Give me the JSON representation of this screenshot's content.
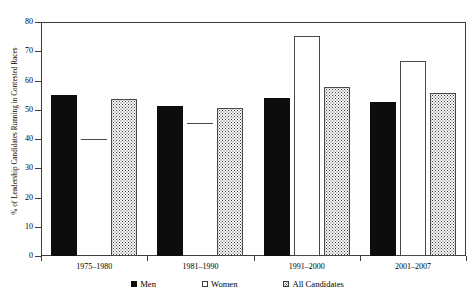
{
  "chart_data": {
    "type": "bar",
    "title": "",
    "xlabel": "",
    "ylabel": "% of Leadership Candidates Running in Contested Races",
    "ylim": [
      0,
      80
    ],
    "yticks": [
      0,
      10,
      20,
      30,
      40,
      50,
      60,
      70,
      80
    ],
    "grid": false,
    "legend_position": "bottom",
    "categories": [
      "1975–1980",
      "1981–1990",
      "1991–2000",
      "2001–2007"
    ],
    "series": [
      {
        "name": "Men",
        "pattern": "solid-black",
        "values": [
          55.2,
          51.3,
          54.0,
          52.5
        ]
      },
      {
        "name": "Women",
        "pattern": "open-white",
        "values": [
          40.0,
          45.5,
          75.3,
          66.8
        ]
      },
      {
        "name": "All Candidates",
        "pattern": "dotted",
        "values": [
          53.7,
          50.5,
          57.8,
          55.8
        ]
      }
    ]
  },
  "axis": {
    "y_title": "% of Leadership Candidates Running in Contested Races",
    "y_labels": [
      "80",
      "70",
      "60",
      "50",
      "40",
      "30",
      "20",
      "10",
      "0"
    ]
  },
  "legend": {
    "items": [
      {
        "label": "Men"
      },
      {
        "label": "Women"
      },
      {
        "label": "All Candidates"
      }
    ]
  },
  "colors": {
    "men": "#0d0d0d",
    "women": "#ffffff",
    "all_candidates": "#fdfdfd",
    "axis": "#3d3d3d",
    "background": "#ffffff"
  }
}
